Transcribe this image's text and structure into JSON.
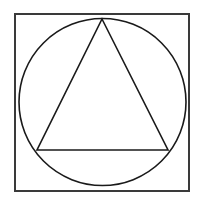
{
  "document": {
    "title": "Geometric Figure",
    "description": "Line drawing of a triangle inscribed in a circle inscribed in a square",
    "canvas": {
      "width": 203,
      "height": 207,
      "background_color": "#ffffff"
    }
  },
  "figure": {
    "type": "geometric-line-drawing",
    "fill_color": "#ffffff",
    "shapes": [
      {
        "name": "square",
        "label": "Square",
        "stroke_color": "#3a3a3a",
        "stroke_width": 2,
        "fill": "none",
        "x": 15,
        "y": 14,
        "width": 174,
        "height": 177
      },
      {
        "name": "circle",
        "label": "Circle",
        "stroke_color": "#1a1a1a",
        "stroke_width": 1.6,
        "fill": "none",
        "cx": 102.5,
        "cy": 102,
        "r": 83.5
      },
      {
        "name": "triangle",
        "label": "Triangle",
        "stroke_color": "#1a1a1a",
        "stroke_width": 1.6,
        "fill": "none",
        "points": "102,19 168,150 37,150",
        "vertices": [
          {
            "name": "apex",
            "x": 102,
            "y": 19
          },
          {
            "name": "base-right",
            "x": 168,
            "y": 150
          },
          {
            "name": "base-left",
            "x": 37,
            "y": 150
          }
        ]
      }
    ]
  }
}
